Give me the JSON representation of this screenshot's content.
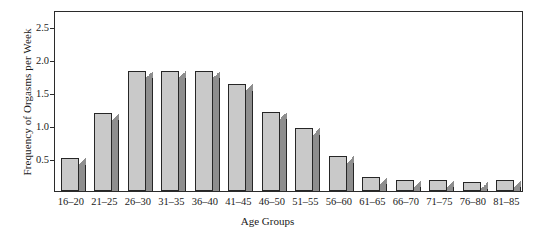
{
  "chart_data": {
    "type": "bar",
    "title": "",
    "xlabel": "Age Groups",
    "ylabel": "Frequency of Orgasms per Week",
    "categories": [
      "16–20",
      "21–25",
      "26–30",
      "31–35",
      "36–40",
      "41–45",
      "46–50",
      "51–55",
      "56–60",
      "61–65",
      "66–70",
      "71–75",
      "76–80",
      "81–85"
    ],
    "values": [
      0.5,
      1.18,
      1.82,
      1.82,
      1.83,
      1.63,
      1.2,
      0.95,
      0.53,
      0.22,
      0.17,
      0.17,
      0.13,
      0.17
    ],
    "ylim": [
      0,
      2.75
    ],
    "yticks": [
      0.5,
      1.0,
      1.5,
      2.0,
      2.5
    ],
    "ytick_labels": [
      "0.5",
      "1.0",
      "1.5",
      "2.0",
      "2.5"
    ],
    "grid": false,
    "legend": null,
    "bar_face_color": "#c9c9c9",
    "bar_side_color": "#8e8e8e",
    "bar_edge_color": "#262626",
    "frame_color": "#2b2b2b",
    "background": "#ffffff"
  }
}
